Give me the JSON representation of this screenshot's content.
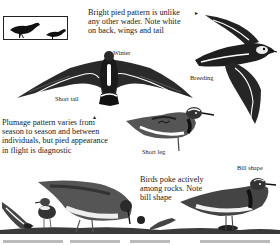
{
  "page": {
    "background": "#ffffff",
    "ink": "#1a1a1a"
  },
  "size_comparison": {
    "icon": "bird-silhouette-size-comparison-icon",
    "items": [
      "large-bird-silhouette",
      "small-bird-silhouette"
    ]
  },
  "captions": {
    "pied_pattern": "Bright pied pattern is unlike any other wader. Note white on back, wings and tail",
    "pied_pattern_lines": [
      "Bright pied pattern is unlike",
      "any other wader. Note white",
      "on back, wings and tail"
    ],
    "plumage": "Plumage pattern varies from season to season and between individuals, but pied appearance in flight is diagnostic",
    "plumage_lines": [
      "Plumage pattern varies from",
      "season to season and between",
      "individuals, but pied appearance",
      "in flight is diagnostic"
    ],
    "feeding": "Birds poke actively among rocks. Note bill shape",
    "feeding_lines": [
      "Birds poke actively",
      "among rocks. Note",
      "bill shape"
    ]
  },
  "labels": {
    "winter": "Winter",
    "breeding": "Breeding",
    "short_tail": "Short tail",
    "short_leg": "Short leg",
    "bill_shape": "Bill shape"
  },
  "pointers": {
    "right_arrow": "▸",
    "up_arrow": "▴"
  },
  "illustrations": [
    {
      "name": "winter-flight-bird",
      "view": "from above, wings spread"
    },
    {
      "name": "breeding-flight-bird",
      "view": "banking flight"
    },
    {
      "name": "standing-bird-short-leg",
      "view": "side profile"
    },
    {
      "name": "feeding-birds-group",
      "view": "foraging among rocks"
    },
    {
      "name": "bill-shape-bird",
      "view": "side profile"
    }
  ]
}
